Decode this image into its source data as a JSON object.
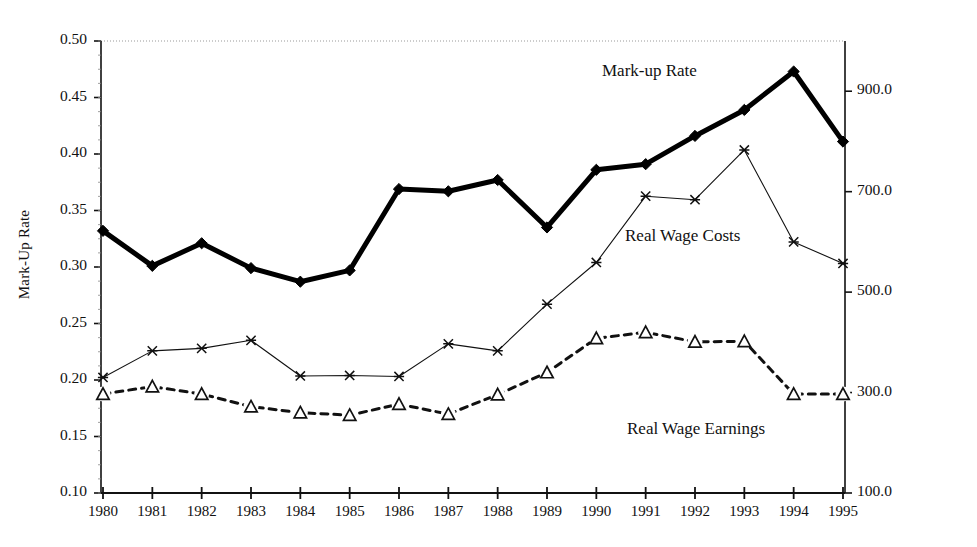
{
  "chart_data": {
    "type": "line",
    "title": "",
    "xlabel": "",
    "categories": [
      "1980",
      "1981",
      "1982",
      "1983",
      "1984",
      "1985",
      "1986",
      "1987",
      "1988",
      "1989",
      "1990",
      "1991",
      "1992",
      "1993",
      "1994",
      "1995"
    ],
    "grid": false,
    "legend_position": "inline-annotations",
    "left_axis": {
      "label": "Mark-Up Rate",
      "ylim": [
        0.1,
        0.5
      ],
      "ticks": [
        "0.10",
        "0.15",
        "0.20",
        "0.25",
        "0.30",
        "0.35",
        "0.40",
        "0.45",
        "0.50"
      ],
      "tick_values": [
        0.1,
        0.15,
        0.2,
        0.25,
        0.3,
        0.35,
        0.4,
        0.45,
        0.5
      ]
    },
    "right_axis": {
      "label": "Real Wage Costs (1980 Prices, Thousands TL)",
      "ylim": [
        100.0,
        1000.0
      ],
      "ticks": [
        "100.0",
        "300.0",
        "500.0",
        "700.0",
        "900.0"
      ],
      "tick_values": [
        100.0,
        300.0,
        500.0,
        700.0,
        900.0
      ]
    },
    "series": [
      {
        "name": "Mark-up Rate",
        "axis": "left",
        "marker": "diamond",
        "line": "solid-bold",
        "color": "#000000",
        "values": [
          0.332,
          0.301,
          0.321,
          0.299,
          0.287,
          0.297,
          0.369,
          0.367,
          0.377,
          0.335,
          0.386,
          0.391,
          0.416,
          0.439,
          0.473,
          0.411
        ]
      },
      {
        "name": "Real Wage Costs",
        "axis": "right",
        "marker": "cross",
        "line": "solid-thin",
        "color": "#000000",
        "values": [
          330,
          383,
          388,
          404,
          333,
          334,
          332,
          397,
          383,
          476,
          559,
          691,
          684,
          783,
          600,
          557
        ]
      },
      {
        "name": "Real Wage Earnings",
        "axis": "right",
        "marker": "triangle",
        "line": "dashed",
        "color": "#000000",
        "values": [
          297,
          312,
          297,
          272,
          260,
          255,
          277,
          257,
          296,
          340,
          408,
          420,
          401,
          402,
          297,
          297
        ]
      }
    ]
  },
  "annotations": {
    "markup_rate": "Mark-up Rate",
    "real_wage_costs": "Real Wage Costs",
    "real_wage_earnings": "Real Wage Earnings"
  }
}
